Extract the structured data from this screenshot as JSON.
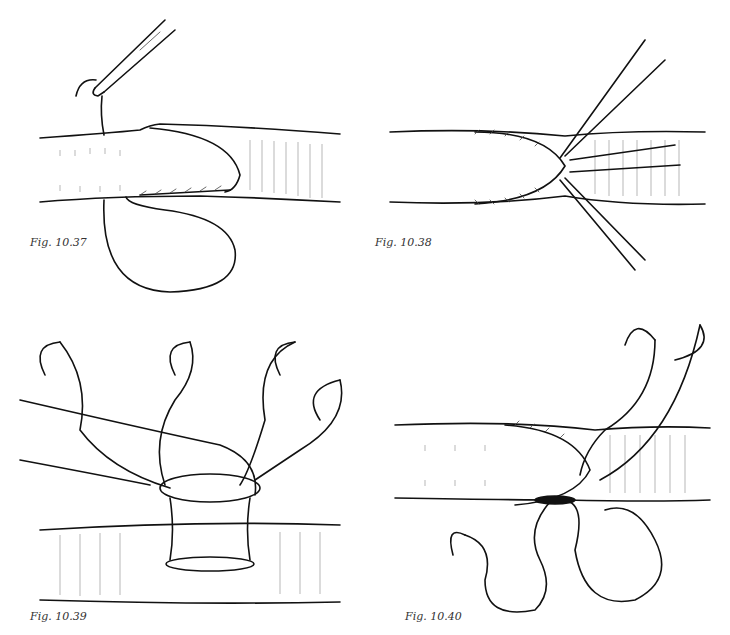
{
  "figures": [
    {
      "id": "fig-10-37",
      "caption": "Fig. 10.37",
      "depicts": "end-to-side anastomosis, running suture with needle holder, suture loop below vessel"
    },
    {
      "id": "fig-10-38",
      "caption": "Fig. 10.38",
      "depicts": "completed suture line with multiple stay sutures at heel"
    },
    {
      "id": "fig-10-39",
      "caption": "Fig. 10.39",
      "depicts": "parachute technique: graft held above recipient vessel with four curved needles"
    },
    {
      "id": "fig-10-40",
      "caption": "Fig. 10.40",
      "depicts": "anastomosis with two needles and suture loops hanging below"
    }
  ]
}
